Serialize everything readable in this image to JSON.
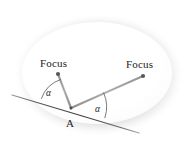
{
  "figure": {
    "type": "geometry-diagram",
    "canvas": {
      "width": 188,
      "height": 151,
      "background": "#ffffff"
    },
    "labels": {
      "focus_left": "Focus",
      "focus_right": "Focus",
      "point_a": "A",
      "alpha_left": "α",
      "alpha_right": "α"
    },
    "colors": {
      "ellipse_fill": "#ffffff",
      "ellipse_shadow": "#b9b9b9",
      "line_stroke": "#4f4f4f",
      "ray_stroke": "#7a7a7a",
      "arc_stroke": "#6b6b6b",
      "dot_fill": "#5a5a5a",
      "text": "#1c1c1c"
    },
    "geometry": {
      "ellipse": {
        "cx": 97,
        "cy": 73,
        "rx": 75,
        "ry": 51
      },
      "focus_left_point": {
        "x": 58,
        "y": 74
      },
      "focus_right_point": {
        "x": 143,
        "y": 76
      },
      "tangent_point_a": {
        "x": 71,
        "y": 108
      },
      "tangent_start": {
        "x": 12,
        "y": 95
      },
      "tangent_end": {
        "x": 139,
        "y": 133
      },
      "angle_left_deg": 42,
      "angle_right_deg": 42
    }
  }
}
